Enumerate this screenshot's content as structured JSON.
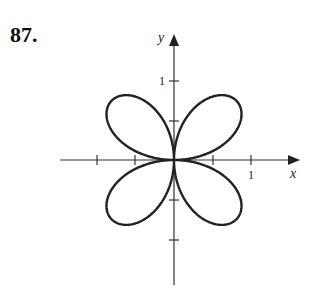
{
  "problem": {
    "number": "87."
  },
  "chart_data": {
    "type": "line",
    "title": "",
    "xlabel": "x",
    "ylabel": "y",
    "x_tick_labels": [
      {
        "value": 1,
        "label": "1"
      }
    ],
    "y_tick_labels": [
      {
        "value": 1,
        "label": "1"
      }
    ],
    "x_ticks": [
      -1.5,
      -1,
      -0.5,
      0.5,
      1
    ],
    "y_ticks": [
      1,
      0.5,
      -0.5,
      -1
    ],
    "xlim": [
      -1.9,
      1.6
    ],
    "ylim": [
      -1.4,
      1.6
    ],
    "grid": false,
    "curve": "r = sin(2θ) style four-leaf rose, petal max radius ≈ 0.9",
    "stroke_color": "#222222"
  },
  "axes": {
    "x_label": "x",
    "y_label": "y",
    "x_one": "1",
    "y_one": "1"
  }
}
